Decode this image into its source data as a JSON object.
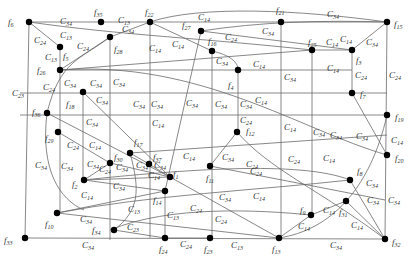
{
  "nodes": [
    {
      "id": "f6",
      "label": "f",
      "sub": "6",
      "x": 29,
      "y": 22,
      "lx": 8,
      "ly": 25
    },
    {
      "id": "f35",
      "label": "f",
      "sub": "35",
      "x": 101,
      "y": 22,
      "lx": 94,
      "ly": 15
    },
    {
      "id": "f22",
      "label": "f",
      "sub": "22",
      "x": 150,
      "y": 22,
      "lx": 145,
      "ly": 15
    },
    {
      "id": "f21",
      "label": "f",
      "sub": "21",
      "x": 281,
      "y": 22,
      "lx": 276,
      "ly": 13
    },
    {
      "id": "f15",
      "label": "f",
      "sub": "15",
      "x": 387,
      "y": 22,
      "lx": 394,
      "ly": 27
    },
    {
      "id": "f27",
      "label": "f",
      "sub": "27",
      "x": 201,
      "y": 31,
      "lx": 182,
      "ly": 28
    },
    {
      "id": "f5",
      "label": "f",
      "sub": "5",
      "x": 60,
      "y": 47,
      "lx": 63,
      "ly": 59
    },
    {
      "id": "f28",
      "label": "f",
      "sub": "28",
      "x": 110,
      "y": 37,
      "lx": 114,
      "ly": 52
    },
    {
      "id": "f16",
      "label": "f",
      "sub": "16",
      "x": 212,
      "y": 51,
      "lx": 208,
      "ly": 44
    },
    {
      "id": "f25",
      "label": "f",
      "sub": "25",
      "x": 312,
      "y": 50,
      "lx": 308,
      "ly": 45
    },
    {
      "id": "f3",
      "label": "f",
      "sub": "3",
      "x": 352,
      "y": 50,
      "lx": 356,
      "ly": 63
    },
    {
      "id": "f26",
      "label": "f",
      "sub": "26",
      "x": 60,
      "y": 70,
      "lx": 37,
      "ly": 73
    },
    {
      "id": "f4",
      "label": "f",
      "sub": "4",
      "x": 238,
      "y": 70,
      "lx": 228,
      "ly": 88
    },
    {
      "id": "f18",
      "label": "f",
      "sub": "18",
      "x": 83,
      "y": 92,
      "lx": 66,
      "ly": 107
    },
    {
      "id": "f7",
      "label": "f",
      "sub": "7",
      "x": 352,
      "y": 93,
      "lx": 360,
      "ly": 97
    },
    {
      "id": "f36",
      "label": "f",
      "sub": "36",
      "x": 47,
      "y": 113,
      "lx": 32,
      "ly": 115
    },
    {
      "id": "f19",
      "label": "f",
      "sub": "19",
      "x": 387,
      "y": 115,
      "lx": 395,
      "ly": 120
    },
    {
      "id": "f12",
      "label": "f",
      "sub": "12",
      "x": 237,
      "y": 132,
      "lx": 246,
      "ly": 134
    },
    {
      "id": "f29",
      "label": "f",
      "sub": "29",
      "x": 58,
      "y": 132,
      "lx": 45,
      "ly": 141
    },
    {
      "id": "f17",
      "label": "f",
      "sub": "17",
      "x": 130,
      "y": 153,
      "lx": 134,
      "ly": 145
    },
    {
      "id": "f37",
      "label": "f",
      "sub": "37",
      "x": 149,
      "y": 164,
      "lx": 153,
      "ly": 160
    },
    {
      "id": "f1",
      "label": "f",
      "sub": "1",
      "x": 170,
      "y": 177,
      "lx": 173,
      "ly": 177
    },
    {
      "id": "f11",
      "label": "f",
      "sub": "11",
      "x": 210,
      "y": 166,
      "lx": 206,
      "ly": 181
    },
    {
      "id": "f30",
      "label": "f",
      "sub": "30",
      "x": 110,
      "y": 163,
      "lx": 114,
      "ly": 160
    },
    {
      "id": "f2",
      "label": "f",
      "sub": "2",
      "x": 84,
      "y": 180,
      "lx": 72,
      "ly": 187
    },
    {
      "id": "f14",
      "label": "f",
      "sub": "14",
      "x": 165,
      "y": 191,
      "lx": 153,
      "ly": 203
    },
    {
      "id": "f20",
      "label": "f",
      "sub": "20",
      "x": 387,
      "y": 155,
      "lx": 395,
      "ly": 161
    },
    {
      "id": "f8",
      "label": "f",
      "sub": "8",
      "x": 350,
      "y": 180,
      "lx": 357,
      "ly": 174
    },
    {
      "id": "f31",
      "label": "f",
      "sub": "31",
      "x": 346,
      "y": 201,
      "lx": 339,
      "ly": 215
    },
    {
      "id": "f9",
      "label": "f",
      "sub": "9",
      "x": 311,
      "y": 215,
      "lx": 300,
      "ly": 213
    },
    {
      "id": "f10",
      "label": "f",
      "sub": "10",
      "x": 57,
      "y": 213,
      "lx": 45,
      "ly": 227
    },
    {
      "id": "f34",
      "label": "f",
      "sub": "34",
      "x": 114,
      "y": 230,
      "lx": 92,
      "ly": 233
    },
    {
      "id": "f24",
      "label": "f",
      "sub": "24",
      "x": 165,
      "y": 238,
      "lx": 159,
      "ly": 252
    },
    {
      "id": "f23",
      "label": "f",
      "sub": "23",
      "x": 210,
      "y": 238,
      "lx": 204,
      "ly": 252
    },
    {
      "id": "f13",
      "label": "f",
      "sub": "13",
      "x": 279,
      "y": 238,
      "lx": 272,
      "ly": 252
    },
    {
      "id": "f32",
      "label": "f",
      "sub": "32",
      "x": 385,
      "y": 239,
      "lx": 392,
      "ly": 245
    },
    {
      "id": "f33",
      "label": "f",
      "sub": "33",
      "x": 25,
      "y": 238,
      "lx": 4,
      "ly": 243
    }
  ],
  "edges": [
    {
      "d": "M29,22 L387,22"
    },
    {
      "d": "M29,22 L25,238"
    },
    {
      "d": "M25,238 L385,239"
    },
    {
      "d": "M387,22 L385,239"
    },
    {
      "d": "M29,22 L60,47"
    },
    {
      "d": "M60,47 L60,70"
    },
    {
      "d": "M60,70 L110,37"
    },
    {
      "d": "M60,70 L312,50"
    },
    {
      "d": "M60,70 L352,70"
    },
    {
      "d": "M110,37 L150,22"
    },
    {
      "d": "M110,37 L110,240"
    },
    {
      "d": "M150,22 L150,238"
    },
    {
      "d": "M150,22 L212,51"
    },
    {
      "d": "M212,51 C230,55 238,62 238,70"
    },
    {
      "d": "M212,51 L212,238"
    },
    {
      "d": "M238,70 L238,132"
    },
    {
      "d": "M281,22 L281,238"
    },
    {
      "d": "M312,50 L312,215"
    },
    {
      "d": "M312,50 L352,50"
    },
    {
      "d": "M352,50 L387,22"
    },
    {
      "d": "M352,50 L352,93"
    },
    {
      "d": "M352,93 L387,155"
    },
    {
      "d": "M60,70 L60,213"
    },
    {
      "d": "M83,92 L83,180"
    },
    {
      "d": "M83,92 L170,177"
    },
    {
      "d": "M47,113 L170,177"
    },
    {
      "d": "M58,132 L110,163"
    },
    {
      "d": "M110,163 L84,180"
    },
    {
      "d": "M110,163 L170,177"
    },
    {
      "d": "M84,180 L165,191"
    },
    {
      "d": "M84,180 L170,177"
    },
    {
      "d": "M57,213 L165,191"
    },
    {
      "d": "M57,213 L279,238"
    },
    {
      "d": "M170,177 L279,238"
    },
    {
      "d": "M165,191 L165,238"
    },
    {
      "d": "M114,230 L165,238"
    },
    {
      "d": "M165,238 L210,238"
    },
    {
      "d": "M210,166 L237,132"
    },
    {
      "d": "M237,132 C270,170 320,190 385,239"
    },
    {
      "d": "M210,166 L385,200"
    },
    {
      "d": "M279,238 L311,215"
    },
    {
      "d": "M311,215 L346,201"
    },
    {
      "d": "M346,201 L385,239"
    },
    {
      "d": "M350,180 L385,239"
    },
    {
      "d": "M20,93 L387,93"
    },
    {
      "d": "M20,115 L387,115"
    },
    {
      "d": "M130,153 L387,135"
    },
    {
      "d": "M130,153 L149,164"
    },
    {
      "d": "M149,164 L170,177"
    },
    {
      "d": "M29,22 C120,35 200,38 312,50"
    },
    {
      "d": "M150,22 C200,5 300,10 387,22"
    },
    {
      "d": "M201,31 L352,50"
    },
    {
      "d": "M201,31 C260,22 320,20 387,22"
    },
    {
      "d": "M201,31 L165,191"
    },
    {
      "d": "M130,153 C140,190 140,210 114,230"
    },
    {
      "d": "M47,113 C40,170 60,200 84,210"
    },
    {
      "d": "M47,113 C60,60 80,60 110,37"
    },
    {
      "d": "M279,238 C330,230 370,190 387,115"
    },
    {
      "d": "M60,70 C200,60 300,130 387,155"
    },
    {
      "d": "M57,213 C150,195 260,190 350,180"
    },
    {
      "d": "M83,180 C180,170 300,160 350,180"
    },
    {
      "d": "M110,230 C170,205 260,210 311,215"
    }
  ],
  "edge_labels": [
    {
      "t": "C",
      "s": "34",
      "x": 60,
      "y": 24
    },
    {
      "t": "C",
      "s": "13",
      "x": 118,
      "y": 23
    },
    {
      "t": "C",
      "s": "24",
      "x": 34,
      "y": 43
    },
    {
      "t": "C",
      "s": "13",
      "x": 60,
      "y": 38
    },
    {
      "t": "C",
      "s": "13",
      "x": 45,
      "y": 60
    },
    {
      "t": "C",
      "s": "24",
      "x": 77,
      "y": 49
    },
    {
      "t": "C",
      "s": "34",
      "x": 122,
      "y": 32
    },
    {
      "t": "C",
      "s": "14",
      "x": 198,
      "y": 20
    },
    {
      "t": "C",
      "s": "14",
      "x": 149,
      "y": 51
    },
    {
      "t": "C",
      "s": "14",
      "x": 172,
      "y": 47
    },
    {
      "t": "C",
      "s": "24",
      "x": 225,
      "y": 40
    },
    {
      "t": "C",
      "s": "34",
      "x": 262,
      "y": 34
    },
    {
      "t": "C",
      "s": "34",
      "x": 216,
      "y": 64
    },
    {
      "t": "C",
      "s": "14",
      "x": 253,
      "y": 67
    },
    {
      "t": "C",
      "s": "34",
      "x": 327,
      "y": 17
    },
    {
      "t": "C",
      "s": "14",
      "x": 326,
      "y": 45
    },
    {
      "t": "C",
      "s": "14",
      "x": 340,
      "y": 42
    },
    {
      "t": "C",
      "s": "34",
      "x": 366,
      "y": 45
    },
    {
      "t": "C",
      "s": "14",
      "x": 327,
      "y": 71
    },
    {
      "t": "C",
      "s": "24",
      "x": 355,
      "y": 78
    },
    {
      "t": "C",
      "s": "24",
      "x": 389,
      "y": 78
    },
    {
      "t": "C",
      "s": "34",
      "x": 284,
      "y": 80
    },
    {
      "t": "C",
      "s": "23",
      "x": 12,
      "y": 96
    },
    {
      "t": "C",
      "s": "24",
      "x": 43,
      "y": 90
    },
    {
      "t": "C",
      "s": "34",
      "x": 64,
      "y": 86
    },
    {
      "t": "C",
      "s": "34",
      "x": 90,
      "y": 86
    },
    {
      "t": "C",
      "s": "34",
      "x": 113,
      "y": 85
    },
    {
      "t": "C",
      "s": "34",
      "x": 96,
      "y": 103
    },
    {
      "t": "C",
      "s": "34",
      "x": 133,
      "y": 107
    },
    {
      "t": "C",
      "s": "34",
      "x": 151,
      "y": 107
    },
    {
      "t": "C",
      "s": "34",
      "x": 186,
      "y": 106
    },
    {
      "t": "C",
      "s": "34",
      "x": 215,
      "y": 107
    },
    {
      "t": "C",
      "s": "34",
      "x": 240,
      "y": 107
    },
    {
      "t": "C",
      "s": "24",
      "x": 240,
      "y": 123
    },
    {
      "t": "C",
      "s": "14",
      "x": 255,
      "y": 103
    },
    {
      "t": "C",
      "s": "34",
      "x": 86,
      "y": 125
    },
    {
      "t": "C",
      "s": "14",
      "x": 152,
      "y": 126
    },
    {
      "t": "C",
      "s": "14",
      "x": 284,
      "y": 130
    },
    {
      "t": "C",
      "s": "34",
      "x": 330,
      "y": 138
    },
    {
      "t": "C",
      "s": "34",
      "x": 313,
      "y": 135
    },
    {
      "t": "C",
      "s": "34",
      "x": 356,
      "y": 139
    },
    {
      "t": "C",
      "s": "14",
      "x": 391,
      "y": 143
    },
    {
      "t": "C",
      "s": "24",
      "x": 67,
      "y": 148
    },
    {
      "t": "C",
      "s": "14",
      "x": 89,
      "y": 148
    },
    {
      "t": "C",
      "s": "34",
      "x": 35,
      "y": 168
    },
    {
      "t": "C",
      "s": "34",
      "x": 61,
      "y": 169
    },
    {
      "t": "C",
      "s": "34",
      "x": 87,
      "y": 167
    },
    {
      "t": "C",
      "s": "24",
      "x": 99,
      "y": 172
    },
    {
      "t": "C",
      "s": "34",
      "x": 116,
      "y": 170
    },
    {
      "t": "C",
      "s": "34",
      "x": 136,
      "y": 168
    },
    {
      "t": "C",
      "s": "34",
      "x": 154,
      "y": 168
    },
    {
      "t": "C",
      "s": "14",
      "x": 183,
      "y": 159
    },
    {
      "t": "C",
      "s": "34",
      "x": 222,
      "y": 160
    },
    {
      "t": "C",
      "s": "24",
      "x": 246,
      "y": 167
    },
    {
      "t": "C",
      "s": "24",
      "x": 288,
      "y": 162
    },
    {
      "t": "C",
      "s": "24",
      "x": 250,
      "y": 174
    },
    {
      "t": "C",
      "s": "14",
      "x": 323,
      "y": 161
    },
    {
      "t": "C",
      "s": "34",
      "x": 113,
      "y": 189
    },
    {
      "t": "C",
      "s": "14",
      "x": 81,
      "y": 198
    },
    {
      "t": "C",
      "s": "34",
      "x": 219,
      "y": 200
    },
    {
      "t": "C",
      "s": "14",
      "x": 253,
      "y": 199
    },
    {
      "t": "C",
      "s": "24",
      "x": 190,
      "y": 211
    },
    {
      "t": "C",
      "s": "13",
      "x": 128,
      "y": 212
    },
    {
      "t": "C",
      "s": "13",
      "x": 167,
      "y": 218
    },
    {
      "t": "C",
      "s": "24",
      "x": 215,
      "y": 222
    },
    {
      "t": "C",
      "s": "34",
      "x": 366,
      "y": 186
    },
    {
      "t": "C",
      "s": "34",
      "x": 367,
      "y": 203
    },
    {
      "t": "C",
      "s": "34",
      "x": 388,
      "y": 203
    },
    {
      "t": "C",
      "s": "14",
      "x": 323,
      "y": 213
    },
    {
      "t": "C",
      "s": "14",
      "x": 298,
      "y": 229
    },
    {
      "t": "C",
      "s": "14",
      "x": 351,
      "y": 228
    },
    {
      "t": "C",
      "s": "23",
      "x": 127,
      "y": 230
    },
    {
      "t": "C",
      "s": "34",
      "x": 82,
      "y": 248
    },
    {
      "t": "C",
      "s": "24",
      "x": 180,
      "y": 247
    },
    {
      "t": "C",
      "s": "13",
      "x": 231,
      "y": 248
    },
    {
      "t": "C",
      "s": "34",
      "x": 330,
      "y": 248
    },
    {
      "t": "C",
      "s": "34",
      "x": 80,
      "y": 222
    },
    {
      "t": "C",
      "s": "14",
      "x": 148,
      "y": 178
    }
  ]
}
